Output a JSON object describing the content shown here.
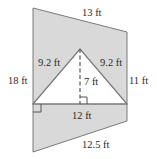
{
  "diagram": {
    "type": "composite-figure",
    "shape": "trapezoid with triangular cut-out",
    "colors": {
      "fill": "#d9d9d9",
      "stroke": "#7a7a7a",
      "hole": "#ffffff"
    },
    "labels": {
      "top": "13 ft",
      "left": "18 ft",
      "right": "11 ft",
      "bottom": "12.5 ft",
      "triangle_left": "9.2 ft",
      "triangle_right": "9.2 ft",
      "triangle_height": "7 ft",
      "triangle_base": "12 ft"
    }
  }
}
